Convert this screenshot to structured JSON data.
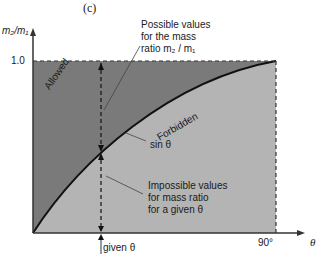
{
  "figure": {
    "panel_label": "(c)",
    "y_axis_label": "m₂/m₁",
    "x_axis_label": "θ",
    "y_tick": "1.0",
    "x_tick": "90°",
    "region_allowed": "Allowed",
    "region_forbidden": "Forbidden",
    "curve_label": "sin θ",
    "annotation_top": [
      "Possible values",
      "for the mass",
      "ratio m₂ / m₁"
    ],
    "annotation_bottom": [
      "Impossible values",
      "for mass ratio",
      "for a given θ"
    ],
    "given_label": "given θ",
    "colors": {
      "allowed_region": "#7a7a7a",
      "forbidden_region": "#b4b4b4",
      "curve": "#111111",
      "background": "#ffffff"
    }
  }
}
